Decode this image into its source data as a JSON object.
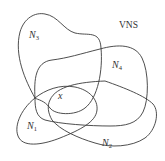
{
  "diagram": {
    "title": "VNS",
    "point_label": "x",
    "stroke_color": "#3a3a3a",
    "background": "#ffffff",
    "neighborhoods": [
      {
        "id": "N1",
        "letter": "N",
        "index": "1"
      },
      {
        "id": "N2",
        "letter": "N",
        "index": "2"
      },
      {
        "id": "N3",
        "letter": "N",
        "index": "3"
      },
      {
        "id": "N4",
        "letter": "N",
        "index": "4"
      }
    ]
  }
}
